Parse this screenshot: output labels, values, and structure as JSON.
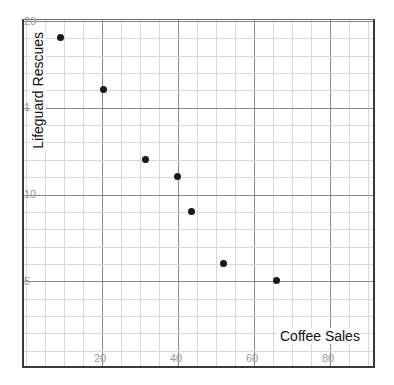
{
  "chart_data": {
    "type": "scatter",
    "title": "",
    "xlabel": "Coffee Sales",
    "ylabel": "Lifeguard Rescues",
    "xlim": [
      0,
      92
    ],
    "ylim": [
      0,
      20.5
    ],
    "grid": true,
    "legend": "none",
    "xticks": [
      20,
      40,
      60,
      80
    ],
    "yticks": [
      5,
      10,
      15,
      20
    ],
    "xtick_labels": [
      "20",
      "40",
      "60",
      "80"
    ],
    "ytick_labels": [
      "5",
      "10",
      "15",
      "20"
    ],
    "minor_grid_step_x": 5,
    "minor_grid_step_y": 1,
    "point_color": "#1a1a1a",
    "grid_color": "#d8d8d8",
    "major_grid_color": "#8a8a8a",
    "axis_color": "#3a3a3a",
    "tick_text_color": "#9a9a9a",
    "points": [
      {
        "x": 9.5,
        "y": 19
      },
      {
        "x": 21,
        "y": 16
      },
      {
        "x": 32,
        "y": 12
      },
      {
        "x": 40.5,
        "y": 11
      },
      {
        "x": 44,
        "y": 9
      },
      {
        "x": 52.5,
        "y": 6
      },
      {
        "x": 66.5,
        "y": 5
      }
    ]
  }
}
